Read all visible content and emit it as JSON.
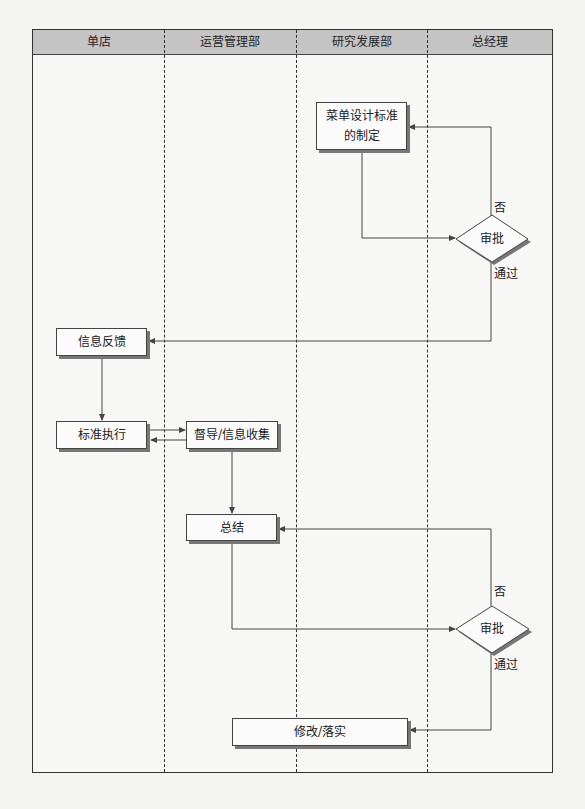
{
  "swimlanes": [
    {
      "name": "单店"
    },
    {
      "name": "运营管理部"
    },
    {
      "name": "研究发展部"
    },
    {
      "name": "总经理"
    }
  ],
  "nodes": {
    "menu_standard": {
      "text": "菜单设计标准的制定",
      "line1": "菜单设计标准",
      "line2": "的制定",
      "lane": "研究发展部"
    },
    "approval_1": {
      "text": "审批",
      "lane": "总经理"
    },
    "info_feedback": {
      "text": "信息反馈",
      "lane": "单店"
    },
    "standard_execution": {
      "text": "标准执行",
      "lane": "单店"
    },
    "supervision": {
      "text": "督导/信息收集",
      "lane": "运营管理部"
    },
    "summary": {
      "text": "总结",
      "lane": "运营管理部"
    },
    "approval_2": {
      "text": "审批",
      "lane": "总经理"
    },
    "revise": {
      "text": "修改/落实",
      "lane": "运营管理部/研究发展部"
    }
  },
  "edge_labels": {
    "approval_1_reject": "否",
    "approval_1_pass": "通过",
    "approval_2_reject": "否",
    "approval_2_pass": "通过"
  },
  "edges": [
    {
      "from": "菜单设计标准的制定",
      "to": "审批"
    },
    {
      "from": "审批",
      "to": "菜单设计标准的制定",
      "label": "否"
    },
    {
      "from": "审批",
      "to": "信息反馈",
      "label": "通过"
    },
    {
      "from": "信息反馈",
      "to": "标准执行"
    },
    {
      "from": "标准执行",
      "to": "督导/信息收集"
    },
    {
      "from": "督导/信息收集",
      "to": "标准执行"
    },
    {
      "from": "督导/信息收集",
      "to": "总结"
    },
    {
      "from": "总结",
      "to": "审批"
    },
    {
      "from": "审批",
      "to": "总结",
      "label": "否"
    },
    {
      "from": "审批",
      "to": "修改/落实",
      "label": "通过"
    }
  ],
  "colors": {
    "header_bg": "#c4c4c4",
    "line": "#444444",
    "shadow": "#777777"
  }
}
